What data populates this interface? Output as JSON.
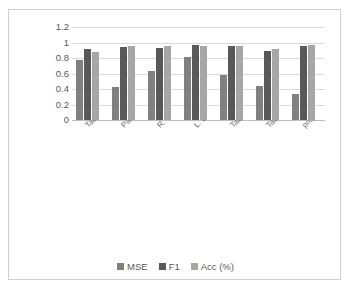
{
  "chart_data": {
    "type": "bar",
    "title": "",
    "xlabel": "",
    "ylabel": "",
    "ylim": [
      0,
      1.2
    ],
    "grid": true,
    "legend_position": "bottom",
    "categories": [
      "Tabelini et al. (2022a)",
      "Pan et al. (2018)",
      "R. Liu et al. (2021)",
      "L. Liu et al. (2021)",
      "Tabelini, Berriel, Paixao, et al. (2021)",
      "Tabelini, Berriel, Paixão, et al. (2021)",
      "proposed"
    ],
    "y_ticks": [
      "0",
      "0.2",
      "0.4",
      "0.6",
      "0.8",
      "1",
      "1.2"
    ],
    "y_tick_values": [
      0,
      0.2,
      0.4,
      0.6,
      0.8,
      1,
      1.2
    ],
    "series": [
      {
        "name": "MSE",
        "color": "#808080",
        "values": [
          0.78,
          0.43,
          0.63,
          0.81,
          0.58,
          0.44,
          0.34
        ]
      },
      {
        "name": "F1",
        "color": "#595959",
        "values": [
          0.92,
          0.94,
          0.93,
          0.97,
          0.95,
          0.89,
          0.95
        ]
      },
      {
        "name": "Acc (%)",
        "color": "#a6a6a6",
        "values": [
          0.88,
          0.95,
          0.96,
          0.95,
          0.95,
          0.92,
          0.97
        ]
      }
    ]
  },
  "legend": {
    "items": [
      {
        "label": "MSE",
        "color": "#808080"
      },
      {
        "label": "F1",
        "color": "#595959"
      },
      {
        "label": "Acc (%)",
        "color": "#a6a6a6"
      }
    ]
  }
}
